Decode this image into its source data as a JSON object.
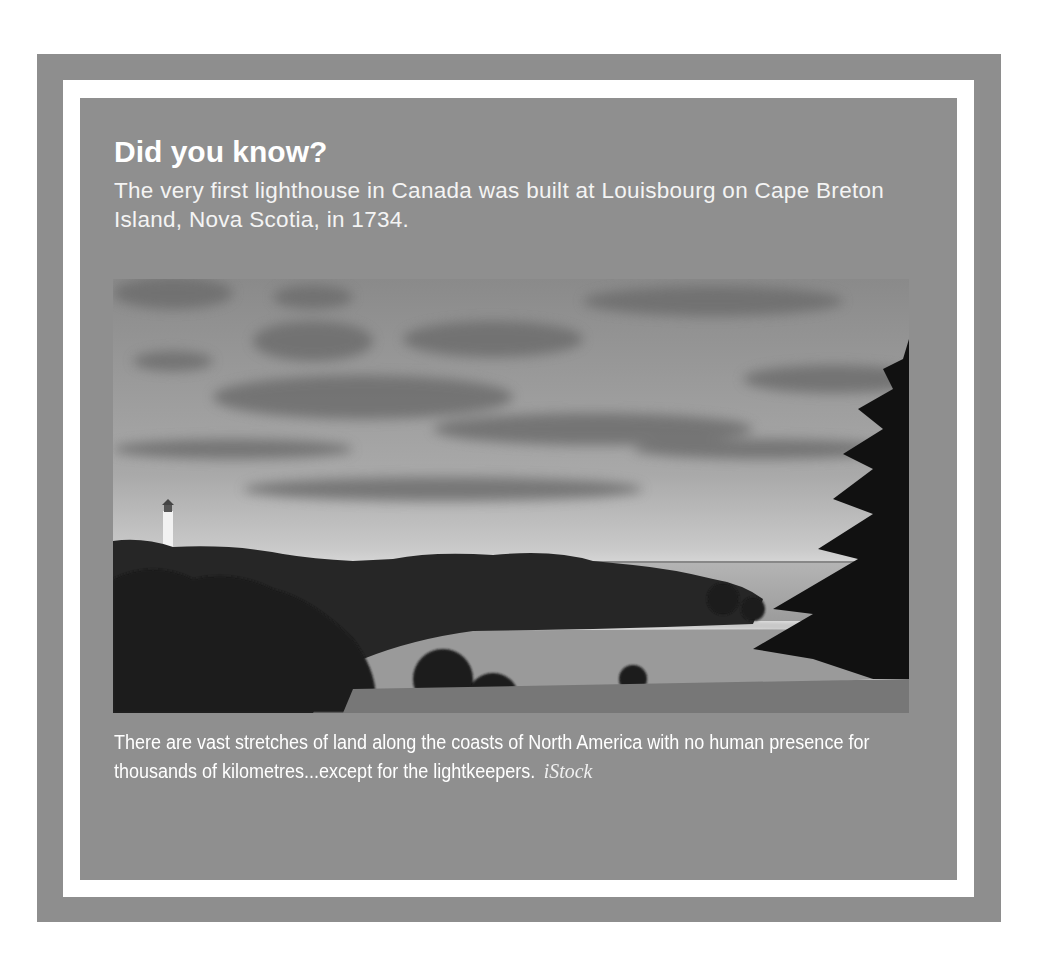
{
  "callout": {
    "heading": "Did you know?",
    "lead_text": "The very first lighthouse in Canada was built at Louisbourg on Cape Breton Island, Nova Scotia, in 1734.",
    "photo": {
      "description": "Black-and-white photo of a coastline with a white lighthouse on a forested hill, a calm inlet, open sea and cloudy sky; an evergreen tree silhouetted at right",
      "icon": "photo-lighthouse-coast"
    },
    "caption": "There are vast stretches of land along the coasts of North America with no human presence for thousands of kilometres...except for the lightkeepers.",
    "credit": "iStock"
  },
  "colors": {
    "frame": "#8e8e8e",
    "rule": "#ffffff",
    "text": "#ffffff"
  }
}
